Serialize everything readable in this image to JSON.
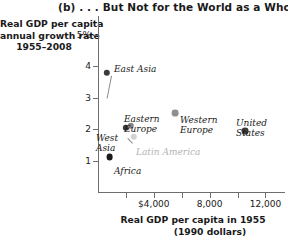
{
  "chart_data": {
    "type": "scatter",
    "title": "(b) . . . But Not for the World as a Whole",
    "xlabel_line1": "Real GDP per capita in 1955",
    "xlabel_line2": "(1990 dollars)",
    "ylabel_line1": "Real GDP per capita",
    "ylabel_line2": "annual growth rate",
    "ylabel_line3": "1955–2008",
    "xlim": [
      0,
      13400
    ],
    "ylim": [
      0,
      5.6
    ],
    "grid": false,
    "legend": "none",
    "xticks": [
      {
        "value": 2000,
        "label": ""
      },
      {
        "value": 4000,
        "label": "$4,000"
      },
      {
        "value": 6000,
        "label": ""
      },
      {
        "value": 8000,
        "label": "8,000"
      },
      {
        "value": 10000,
        "label": ""
      },
      {
        "value": 12000,
        "label": "12,000"
      }
    ],
    "yticks": [
      {
        "value": 5,
        "label": "5%"
      },
      {
        "value": 4,
        "label": "4"
      },
      {
        "value": 3,
        "label": "3"
      },
      {
        "value": 2,
        "label": "2"
      },
      {
        "value": 1,
        "label": "1"
      }
    ],
    "points": [
      {
        "name": "East Asia",
        "x": 650,
        "y": 3.8,
        "color": "#3a3a3a",
        "r": 3.2
      },
      {
        "name": "West Asia",
        "x": 2000,
        "y": 2.05,
        "color": "#3a3a3a",
        "r": 3.2
      },
      {
        "name": "Eastern Europe",
        "x": 2330,
        "y": 2.1,
        "color": "#858585",
        "r": 3.2
      },
      {
        "name": "Latin America",
        "x": 2560,
        "y": 1.75,
        "color": "#d2d2d2",
        "r": 3.2
      },
      {
        "name": "Africa",
        "x": 830,
        "y": 1.1,
        "color": "#1a1a1a",
        "r": 3.4
      },
      {
        "name": "Western Europe",
        "x": 5550,
        "y": 2.5,
        "color": "#8f8f8f",
        "r": 3.4
      },
      {
        "name": "United States",
        "x": 10550,
        "y": 1.95,
        "color": "#3a3a3a",
        "r": 3.4
      }
    ]
  }
}
